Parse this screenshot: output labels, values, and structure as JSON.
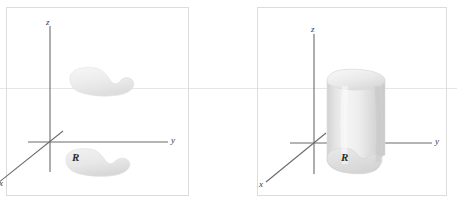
{
  "figure": {
    "background_color": "#ffffff",
    "width": 457,
    "height": 205,
    "page_rule_color": "#e6e6e6",
    "panel_border_color": "#dcdcdc",
    "axis_color": "#6b6b6b",
    "surface_fill_light": "#efefef",
    "surface_fill_mid": "#e2e2e2",
    "surface_fill_dark": "#cfcfcf"
  },
  "panels": [
    {
      "id": "left",
      "name": "region-and-surface-panel",
      "axes": [
        {
          "name": "z-axis",
          "label": "z"
        },
        {
          "name": "y-axis",
          "label": "y"
        },
        {
          "name": "x-axis",
          "label": "x"
        }
      ],
      "shapes": [
        {
          "name": "upper-surface-blob",
          "label": ""
        },
        {
          "name": "base-region-blob",
          "label": "R"
        }
      ],
      "labels": {
        "z": "z",
        "y": "y",
        "x": "x",
        "region": "R"
      }
    },
    {
      "id": "right",
      "name": "solid-cylinder-panel",
      "axes": [
        {
          "name": "z-axis",
          "label": "z"
        },
        {
          "name": "y-axis",
          "label": "y"
        },
        {
          "name": "x-axis",
          "label": "x"
        }
      ],
      "shapes": [
        {
          "name": "solid-cylinder",
          "label": ""
        },
        {
          "name": "base-region-blob",
          "label": "R"
        }
      ],
      "labels": {
        "z": "z",
        "y": "y",
        "x": "x",
        "region": "R"
      }
    }
  ]
}
